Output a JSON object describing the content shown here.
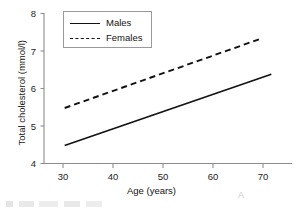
{
  "chart_data": {
    "type": "line",
    "title": "",
    "xlabel": "Age (years)",
    "ylabel": "Total cholesterol (mmol/l)",
    "xlim": [
      26,
      74
    ],
    "ylim": [
      4,
      8
    ],
    "xticks": [
      30,
      40,
      50,
      60,
      70
    ],
    "yticks": [
      4,
      5,
      6,
      7,
      8
    ],
    "xtick_labels": [
      "30",
      "40",
      "50",
      "60",
      "70"
    ],
    "ytick_labels": [
      "4",
      "5",
      "6",
      "7",
      "8"
    ],
    "grid": false,
    "legend_position": "upper left",
    "series": [
      {
        "name": "Males",
        "style": "solid",
        "color": "#111111",
        "x": [
          30,
          70
        ],
        "values": [
          4.48,
          6.38
        ]
      },
      {
        "name": "Females",
        "style": "dashed",
        "color": "#111111",
        "x": [
          30,
          68
        ],
        "values": [
          5.48,
          7.33
        ]
      }
    ]
  },
  "axes": {
    "x_title": "Age (years)",
    "y_title": "Total cholesterol (mmol/l)",
    "x_ticks": [
      {
        "label": "30"
      },
      {
        "label": "40"
      },
      {
        "label": "50"
      },
      {
        "label": "60"
      },
      {
        "label": "70"
      }
    ],
    "y_ticks": [
      {
        "label": "8"
      },
      {
        "label": "7"
      },
      {
        "label": "6"
      },
      {
        "label": "5"
      },
      {
        "label": "4"
      }
    ]
  },
  "legend": {
    "items": [
      {
        "label": "Males",
        "style": "solid"
      },
      {
        "label": "Females",
        "style": "dashed"
      }
    ]
  },
  "colors": {
    "ink": "#111111",
    "axis": "#8d8d8d",
    "legend_border": "#9a9a9a",
    "background": "#ffffff"
  }
}
